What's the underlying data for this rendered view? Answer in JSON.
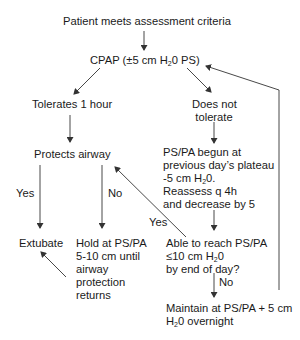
{
  "nodes": {
    "start": "Patient meets assessment criteria",
    "cpap_pre": "CPAP (±5 cm H",
    "cpap_sub": "2",
    "cpap_post": "0 PS)",
    "tolerates": "Tolerates 1 hour",
    "not_tolerate_1": "Does not",
    "not_tolerate_2": "tolerate",
    "protects": "Protects airway",
    "pspa_1": "PS/PA begun at",
    "pspa_2": "previous day’s plateau",
    "pspa_3_pre": "-5 cm H",
    "pspa_3_sub": "2",
    "pspa_3_post": "0.",
    "pspa_4": "Reassess q 4h",
    "pspa_5": "and decrease by 5",
    "extubate": "Extubate",
    "hold_1": "Hold at PS/PA",
    "hold_2": "5-10 cm until",
    "hold_3": "airway",
    "hold_4": "protection",
    "hold_5": "returns",
    "able_1": "Able to reach PS/PA",
    "able_2_pre": "≤10 cm H",
    "able_2_sub": "2",
    "able_2_post": "0",
    "able_3": "by end of day?",
    "maintain_1": "Maintain at PS/PA + 5 cm",
    "maintain_2_pre": "H",
    "maintain_2_sub": "2",
    "maintain_2_post": "0 overnight"
  },
  "edge_labels": {
    "yes_left": "Yes",
    "no_left": "No",
    "yes_mid": "Yes",
    "no_right": "No"
  },
  "colors": {
    "line": "#333333",
    "text": "#1a1a1a"
  }
}
